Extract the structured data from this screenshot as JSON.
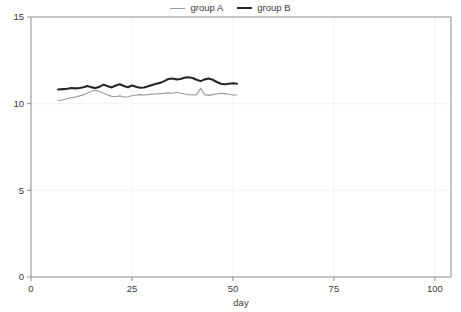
{
  "legend": {
    "position": "top-center",
    "entries": [
      {
        "label": "group A",
        "color": "#9a9a9a",
        "width": 1.1
      },
      {
        "label": "group B",
        "color": "#262626",
        "width": 2.1
      }
    ]
  },
  "chart_data": {
    "type": "line",
    "title": "",
    "xlabel": "day",
    "ylabel": "",
    "xlim": [
      0,
      104
    ],
    "ylim": [
      0,
      15
    ],
    "xticks": [
      0,
      25,
      50,
      75,
      100
    ],
    "xtick_labels": [
      "0",
      "25",
      "50",
      "75",
      "100"
    ],
    "yticks": [
      0,
      5,
      10,
      15
    ],
    "ytick_labels": [
      "0",
      "5",
      "10",
      "15"
    ],
    "grid": true,
    "grid_color": "#f2f2f2",
    "axis_color": "#8c8c8c",
    "series": [
      {
        "name": "group A",
        "color": "#9a9a9a",
        "width": 1.1,
        "x": [
          6.7,
          8,
          9,
          10,
          11,
          12,
          13,
          14,
          15,
          16,
          17,
          18,
          19,
          20,
          21,
          22,
          23,
          24,
          25,
          26,
          27,
          28,
          29,
          30,
          31,
          32,
          33,
          34,
          35,
          36,
          37,
          38,
          39,
          40,
          41,
          42,
          43,
          44,
          45,
          46,
          47,
          48,
          49,
          50,
          51
        ],
        "y": [
          10.18,
          10.22,
          10.3,
          10.36,
          10.38,
          10.45,
          10.5,
          10.62,
          10.72,
          10.78,
          10.7,
          10.6,
          10.5,
          10.42,
          10.4,
          10.45,
          10.38,
          10.4,
          10.46,
          10.5,
          10.52,
          10.5,
          10.52,
          10.55,
          10.56,
          10.58,
          10.6,
          10.62,
          10.6,
          10.66,
          10.6,
          10.56,
          10.52,
          10.5,
          10.52,
          10.88,
          10.52,
          10.48,
          10.52,
          10.56,
          10.6,
          10.58,
          10.54,
          10.5,
          10.5
        ]
      },
      {
        "name": "group B",
        "color": "#262626",
        "width": 2.1,
        "x": [
          6.7,
          8,
          9,
          10,
          11,
          12,
          13,
          14,
          15,
          16,
          17,
          18,
          19,
          20,
          21,
          22,
          23,
          24,
          25,
          26,
          27,
          28,
          29,
          30,
          31,
          32,
          33,
          34,
          35,
          36,
          37,
          38,
          39,
          40,
          41,
          42,
          43,
          44,
          45,
          46,
          47,
          48,
          49,
          50,
          51
        ],
        "y": [
          10.82,
          10.84,
          10.86,
          10.9,
          10.88,
          10.9,
          10.95,
          11.02,
          10.94,
          10.9,
          10.98,
          11.1,
          11.0,
          10.94,
          11.05,
          11.12,
          11.02,
          10.95,
          11.05,
          10.98,
          10.92,
          10.93,
          11.0,
          11.08,
          11.15,
          11.2,
          11.3,
          11.42,
          11.45,
          11.4,
          11.42,
          11.5,
          11.52,
          11.48,
          11.38,
          11.3,
          11.4,
          11.45,
          11.38,
          11.25,
          11.15,
          11.12,
          11.15,
          11.18,
          11.15
        ]
      }
    ]
  }
}
